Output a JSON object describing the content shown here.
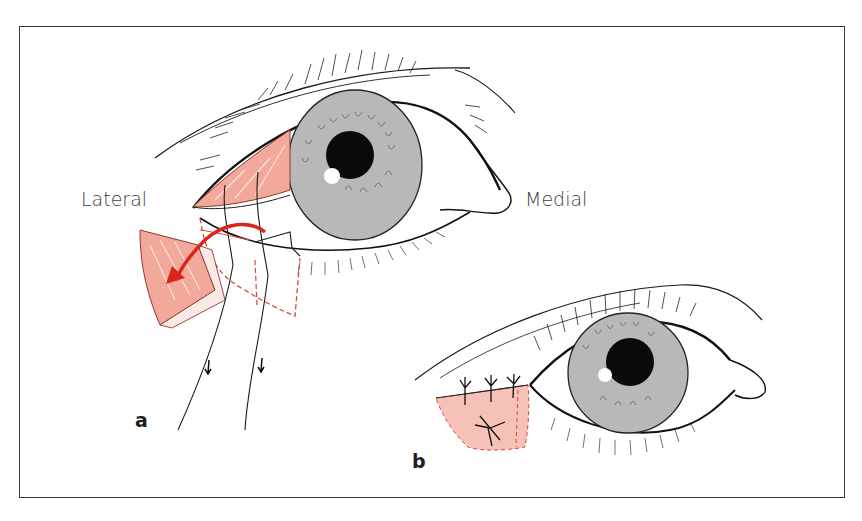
{
  "figure": {
    "labels": {
      "lateral": "Lateral",
      "medial": "Medial"
    },
    "panels": [
      {
        "id": "a",
        "label": "a"
      },
      {
        "id": "b",
        "label": "b"
      }
    ],
    "colors": {
      "frame": "#3a3a3a",
      "flap_fill": "#f2a99c",
      "flap_light": "#f9d3cb",
      "arrow_red": "#d9261c",
      "dashed_red": "#d9473a",
      "iris_gray": "#b8b8b8",
      "pupil": "#0a0a0a",
      "line": "#1a1a1a"
    }
  }
}
